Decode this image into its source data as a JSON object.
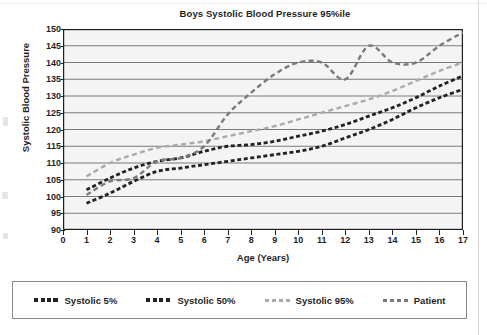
{
  "chart_data": {
    "type": "line",
    "title": "Boys Systolic Blood Pressure 95%ile",
    "xlabel": "Age (Years)",
    "ylabel": "Systolic Blood Pressure",
    "xlim": [
      0,
      17
    ],
    "ylim": [
      90,
      150
    ],
    "xticks": [
      "0",
      "1",
      "2",
      "3",
      "4",
      "5",
      "6",
      "7",
      "8",
      "9",
      "10",
      "11",
      "12",
      "13",
      "14",
      "15",
      "16",
      "17"
    ],
    "yticks": [
      "150",
      "145",
      "140",
      "135",
      "130",
      "125",
      "120",
      "115",
      "110",
      "105",
      "100",
      "95",
      "90"
    ],
    "grid": "horizontal",
    "legend_position": "below-plot",
    "x": [
      1,
      2,
      3,
      4,
      5,
      6,
      7,
      8,
      9,
      10,
      11,
      12,
      13,
      14,
      15,
      16,
      17
    ],
    "series": [
      {
        "name": "Systolic 5%",
        "color": "#222222",
        "style": "dashed",
        "values": [
          98,
          101,
          104.5,
          107.5,
          108.5,
          109.5,
          110.5,
          111.5,
          112.5,
          113.5,
          115,
          117.5,
          120,
          123,
          126.5,
          129.5,
          132
        ]
      },
      {
        "name": "Systolic 50%",
        "color": "#222222",
        "style": "dashed",
        "values": [
          102,
          105.5,
          108.5,
          110.5,
          111.5,
          113.5,
          115,
          115.5,
          116.5,
          118,
          119.5,
          121.5,
          124,
          126.5,
          129.5,
          133,
          136
        ]
      },
      {
        "name": "Systolic 95%",
        "color": "#aaaaaa",
        "style": "dashed",
        "values": [
          106,
          110,
          112.5,
          114.5,
          115.5,
          116.5,
          118,
          119.5,
          121,
          123,
          125,
          127,
          129,
          131.5,
          134.5,
          137.5,
          140
        ]
      },
      {
        "name": "Patient",
        "color": "#7a7a7a",
        "style": "dashed",
        "values": [
          100.5,
          104.5,
          105.5,
          110.5,
          111.5,
          115,
          124.5,
          131,
          136.5,
          140,
          140,
          135,
          145,
          140,
          140,
          145,
          149
        ]
      }
    ]
  },
  "chart": {
    "title": "Boys Systolic Blood Pressure 95%ile",
    "x_axis_title": "Age (Years)",
    "y_axis_title": "Systolic Blood Pressure"
  },
  "legend": {
    "items": [
      {
        "label": "Systolic 5%",
        "color": "#222222"
      },
      {
        "label": "Systolic 50%",
        "color": "#222222"
      },
      {
        "label": "Systolic 95%",
        "color": "#aaaaaa"
      },
      {
        "label": "Patient",
        "color": "#7a7a7a"
      }
    ]
  }
}
